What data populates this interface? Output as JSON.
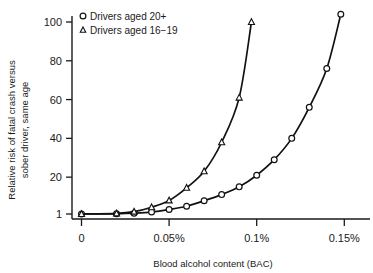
{
  "chart_data": {
    "type": "line",
    "title": "",
    "xlabel": "Blood alcohol content (BAC)",
    "ylabel_line1": "Relative risk of fatal crash versus",
    "ylabel_line2": "sober driver, same age",
    "xlim": [
      0,
      0.1585
    ],
    "ylim": [
      1,
      108
    ],
    "grid": false,
    "legend_position": "top-left",
    "xticks": [
      0,
      0.05,
      0.1,
      0.15
    ],
    "xtick_labels": [
      "0",
      "0.05%",
      "0.1%",
      "0.15%"
    ],
    "yticks": [
      1,
      20,
      40,
      60,
      80,
      100
    ],
    "ytick_labels": [
      "1",
      "20",
      "40",
      "60",
      "80",
      "100"
    ],
    "series": [
      {
        "name": "Drivers aged 20+",
        "marker": "circle",
        "x": [
          0,
          0.02,
          0.03,
          0.04,
          0.05,
          0.06,
          0.07,
          0.08,
          0.09,
          0.1,
          0.11,
          0.12,
          0.13,
          0.14,
          0.148
        ],
        "values": [
          1.0,
          1.1,
          1.4,
          2.0,
          3.3,
          5.0,
          7.8,
          11.0,
          15.0,
          21.0,
          29.0,
          40.0,
          56.0,
          76.0,
          104.0
        ]
      },
      {
        "name": "Drivers aged 16−19",
        "marker": "triangle",
        "x": [
          0,
          0.02,
          0.03,
          0.04,
          0.05,
          0.06,
          0.07,
          0.08,
          0.09,
          0.097
        ],
        "values": [
          1.0,
          1.3,
          2.2,
          4.5,
          8.0,
          14.5,
          23.0,
          38.0,
          61.0,
          100.0
        ]
      }
    ]
  },
  "legend": {
    "items": [
      {
        "label": "Drivers aged 20+",
        "marker": "circle"
      },
      {
        "label": "Drivers aged 16−19",
        "marker": "triangle"
      }
    ]
  }
}
